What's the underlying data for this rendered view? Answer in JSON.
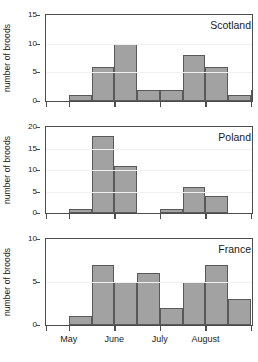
{
  "chart_data": {
    "type": "bar",
    "title": "",
    "xlabel": "",
    "ylabel": "number of broods",
    "grid": true,
    "legend": "none",
    "bin_labels": [
      "early May",
      "late May",
      "early June",
      "mid June",
      "late June",
      "early July",
      "mid July",
      "late July",
      "early August"
    ],
    "x_tick_labels": [
      "May",
      "June",
      "July",
      "August"
    ],
    "x_tick_positions": [
      1,
      3,
      5,
      7
    ],
    "x_axis_range": [
      0,
      9
    ],
    "panels": [
      {
        "name": "Scotland",
        "ylabel": "number of broods",
        "ylim": [
          0,
          15
        ],
        "yticks": [
          0,
          5,
          10,
          15
        ],
        "values": [
          0,
          1,
          6,
          10,
          2,
          2,
          8,
          6,
          1,
          2
        ],
        "bar_start_index": 0
      },
      {
        "name": "Poland",
        "ylabel": "number of broods",
        "ylim": [
          0,
          20
        ],
        "yticks": [
          0,
          5,
          10,
          15,
          20
        ],
        "values": [
          0,
          1,
          18,
          11,
          0,
          1,
          6,
          4,
          0,
          0
        ],
        "bar_start_index": 0
      },
      {
        "name": "France",
        "ylabel": "number of broods",
        "ylim": [
          0,
          10
        ],
        "yticks": [
          0,
          5,
          10
        ],
        "values": [
          0,
          1,
          7,
          5,
          6,
          2,
          5,
          7,
          3,
          0
        ],
        "bar_start_index": 0
      }
    ]
  },
  "panel_titles": {
    "scotland": "Scotland",
    "poland": "Poland",
    "france": "France"
  }
}
